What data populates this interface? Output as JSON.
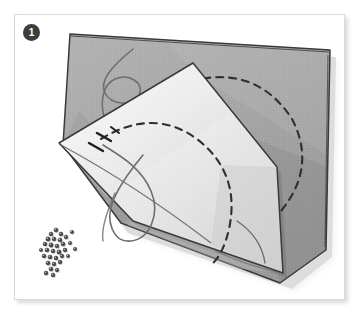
{
  "figure": {
    "step_number": "1",
    "caption": "",
    "alt_description": "Step 1: gray fabric square with white corner folded back, dashed stitching arcs marked, thread loops and a pile of beads"
  },
  "colors": {
    "page_background": "#ffffff",
    "frame_background": "#ffffff",
    "frame_border": "#d9d9d9",
    "badge_fill": "#3d3d3d",
    "badge_text": "#ffffff",
    "fabric_gray": "#a9a9a9",
    "fabric_gray_shade": "#9b9b9b",
    "fabric_gray_light": "#b6b6b6",
    "fabric_white": "#f2f2f2",
    "fabric_white_shade": "#dcdcdc",
    "outline_ink": "#3a3a3a",
    "stitch_ink": "#2f2f2f",
    "thread_ink": "#6e6e6e",
    "bead_fill": "#4a4a4a",
    "shadow": "rgba(0,0,0,0.14)"
  },
  "scene": {
    "objects": [
      {
        "name": "gray-fabric-square",
        "label": "Gray fabric square"
      },
      {
        "name": "folded-white-corner",
        "label": "Folded-back white corner"
      },
      {
        "name": "dashed-arc-upper",
        "label": "Dashed stitching arc on gray fabric"
      },
      {
        "name": "dashed-arc-lower",
        "label": "Dashed stitching arc on white flap"
      },
      {
        "name": "thread-curl-upper",
        "label": "Curled thread on gray fabric"
      },
      {
        "name": "thread-loop-lower",
        "label": "Looped thread across fold"
      },
      {
        "name": "stitch-marks",
        "label": "Hand stitch marks"
      },
      {
        "name": "bead-pile",
        "label": "Pile of beads"
      }
    ],
    "bead_count": 31,
    "beads": [
      {
        "cx": 36,
        "cy": 219,
        "r": 2.0
      },
      {
        "cx": 41,
        "cy": 215,
        "r": 2.1
      },
      {
        "cx": 46,
        "cy": 219,
        "r": 2.0
      },
      {
        "cx": 33,
        "cy": 224,
        "r": 2.2
      },
      {
        "cx": 39,
        "cy": 224,
        "r": 2.0
      },
      {
        "cx": 45,
        "cy": 225,
        "r": 2.1
      },
      {
        "cx": 51,
        "cy": 222,
        "r": 1.9
      },
      {
        "cx": 30,
        "cy": 229,
        "r": 2.0
      },
      {
        "cx": 36,
        "cy": 230,
        "r": 2.2
      },
      {
        "cx": 42,
        "cy": 231,
        "r": 2.0
      },
      {
        "cx": 48,
        "cy": 229,
        "r": 2.1
      },
      {
        "cx": 55,
        "cy": 228,
        "r": 1.8
      },
      {
        "cx": 32,
        "cy": 235,
        "r": 2.1
      },
      {
        "cx": 38,
        "cy": 236,
        "r": 2.0
      },
      {
        "cx": 44,
        "cy": 237,
        "r": 2.2
      },
      {
        "cx": 50,
        "cy": 235,
        "r": 2.0
      },
      {
        "cx": 29,
        "cy": 241,
        "r": 2.0
      },
      {
        "cx": 35,
        "cy": 242,
        "r": 2.1
      },
      {
        "cx": 41,
        "cy": 243,
        "r": 2.0
      },
      {
        "cx": 47,
        "cy": 241,
        "r": 1.9
      },
      {
        "cx": 33,
        "cy": 248,
        "r": 2.1
      },
      {
        "cx": 39,
        "cy": 249,
        "r": 2.0
      },
      {
        "cx": 45,
        "cy": 247,
        "r": 2.0
      },
      {
        "cx": 36,
        "cy": 254,
        "r": 2.1
      },
      {
        "cx": 42,
        "cy": 255,
        "r": 1.9
      },
      {
        "cx": 31,
        "cy": 258,
        "r": 2.0
      },
      {
        "cx": 38,
        "cy": 260,
        "r": 2.0
      },
      {
        "cx": 57,
        "cy": 217,
        "r": 1.8
      },
      {
        "cx": 60,
        "cy": 234,
        "r": 1.8
      },
      {
        "cx": 53,
        "cy": 241,
        "r": 1.7
      },
      {
        "cx": 26,
        "cy": 235,
        "r": 1.7
      }
    ]
  }
}
